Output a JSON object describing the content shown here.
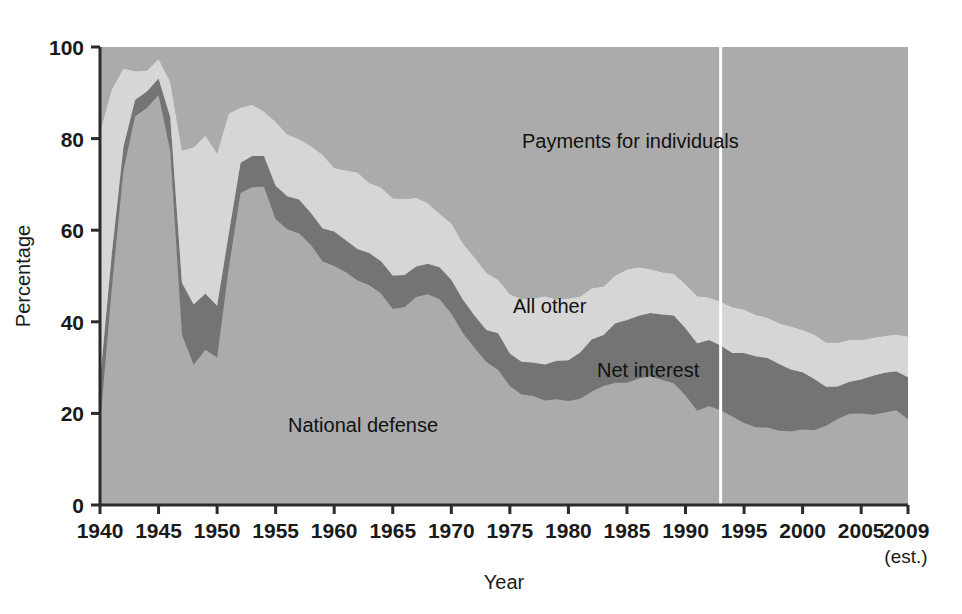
{
  "chart_data": {
    "type": "area",
    "stacked": true,
    "title": "",
    "xlabel": "Year",
    "ylabel": "Percentage",
    "xlim": [
      1940,
      2009
    ],
    "ylim": [
      0,
      100
    ],
    "grid": false,
    "legend_position": "inline-annotations",
    "x_tick_labels": [
      "1940",
      "1945",
      "1950",
      "1955",
      "1960",
      "1965",
      "1970",
      "1975",
      "1980",
      "1985",
      "1990",
      "1995",
      "2000",
      "2005",
      "2009"
    ],
    "x_tick_values": [
      1940,
      1945,
      1950,
      1955,
      1960,
      1965,
      1970,
      1975,
      1980,
      1985,
      1990,
      1995,
      2000,
      2005,
      2009
    ],
    "y_tick_labels": [
      "0",
      "20",
      "40",
      "60",
      "80",
      "100"
    ],
    "y_tick_values": [
      0,
      20,
      40,
      60,
      80,
      100
    ],
    "last_point_note": "(est.)",
    "projection_divider_year": 1993,
    "colors": {
      "national_defense": "#ababab",
      "net_interest": "#747474",
      "all_other": "#d6d6d6",
      "payments_for_individuals": "#ababab",
      "plot_background": "#ababab",
      "axis": "#2b2b2b",
      "divider": "#ffffff"
    },
    "x": [
      1940,
      1941,
      1942,
      1943,
      1944,
      1945,
      1946,
      1947,
      1948,
      1949,
      1950,
      1951,
      1952,
      1953,
      1954,
      1955,
      1956,
      1957,
      1958,
      1959,
      1960,
      1961,
      1962,
      1963,
      1964,
      1965,
      1966,
      1967,
      1968,
      1969,
      1970,
      1971,
      1972,
      1973,
      1974,
      1975,
      1976,
      1977,
      1978,
      1979,
      1980,
      1981,
      1982,
      1983,
      1984,
      1985,
      1986,
      1987,
      1988,
      1989,
      1990,
      1991,
      1992,
      1993,
      1994,
      1995,
      1996,
      1997,
      1998,
      1999,
      2000,
      2001,
      2002,
      2003,
      2004,
      2005,
      2006,
      2007,
      2008,
      2009
    ],
    "series": [
      {
        "name": "National defense",
        "color": "#ababab",
        "values": [
          17.5,
          47.1,
          73.0,
          84.9,
          86.7,
          89.5,
          77.3,
          37.1,
          30.6,
          33.9,
          32.2,
          51.8,
          68.1,
          69.4,
          69.5,
          62.4,
          60.2,
          59.3,
          56.8,
          53.2,
          52.2,
          50.8,
          49.0,
          48.0,
          46.2,
          42.8,
          43.2,
          45.4,
          46.0,
          44.9,
          41.8,
          37.5,
          34.3,
          31.2,
          29.5,
          26.0,
          24.1,
          23.8,
          22.8,
          23.1,
          22.7,
          23.2,
          24.8,
          26.0,
          26.7,
          26.7,
          27.6,
          28.1,
          27.3,
          26.6,
          23.9,
          20.6,
          21.6,
          20.7,
          19.3,
          17.9,
          17.0,
          16.9,
          16.2,
          16.1,
          16.5,
          16.4,
          17.3,
          18.8,
          19.9,
          20.0,
          19.7,
          20.2,
          20.7,
          18.7
        ]
      },
      {
        "name": "Net interest",
        "color": "#747474",
        "values": [
          9.5,
          7.6,
          5.2,
          3.6,
          3.6,
          3.6,
          7.4,
          11.4,
          13.2,
          12.3,
          11.3,
          7.5,
          6.6,
          6.8,
          6.7,
          7.3,
          7.2,
          7.4,
          7.0,
          7.2,
          7.5,
          7.0,
          6.9,
          7.0,
          7.0,
          7.3,
          7.0,
          6.7,
          6.7,
          7.0,
          7.4,
          7.3,
          7.0,
          7.0,
          8.0,
          7.1,
          7.2,
          7.3,
          7.9,
          8.4,
          8.9,
          10.1,
          11.4,
          11.1,
          13.0,
          13.7,
          13.7,
          13.8,
          14.3,
          14.8,
          14.7,
          14.7,
          14.4,
          14.1,
          13.9,
          15.3,
          15.5,
          15.2,
          14.6,
          13.5,
          12.5,
          11.1,
          8.5,
          7.1,
          7.0,
          7.4,
          8.5,
          8.7,
          8.5,
          9.2
        ]
      },
      {
        "name": "All other",
        "color": "#d6d6d6",
        "values": [
          54.5,
          36.0,
          17.1,
          6.2,
          4.5,
          4.3,
          7.7,
          28.9,
          34.3,
          34.5,
          33.3,
          26.2,
          12.1,
          11.2,
          9.7,
          14.0,
          13.5,
          13.2,
          14.6,
          16.1,
          13.9,
          15.3,
          16.7,
          15.3,
          16.1,
          16.9,
          16.6,
          15.0,
          13.2,
          11.7,
          12.3,
          12.3,
          12.7,
          12.5,
          11.7,
          12.9,
          13.7,
          14.0,
          14.9,
          13.4,
          13.5,
          12.2,
          11.1,
          10.6,
          10.4,
          11.0,
          10.6,
          9.6,
          9.2,
          9.1,
          9.6,
          10.3,
          9.3,
          9.6,
          10.0,
          9.5,
          9.0,
          8.8,
          8.9,
          9.4,
          9.2,
          9.7,
          9.7,
          9.5,
          9.1,
          8.6,
          8.3,
          8.0,
          8.0,
          8.9
        ]
      },
      {
        "name": "Payments for individuals",
        "color": "#ababab",
        "values": [
          18.5,
          9.3,
          4.7,
          5.3,
          5.2,
          2.6,
          7.6,
          22.6,
          21.9,
          19.3,
          23.2,
          14.5,
          13.2,
          12.6,
          14.1,
          16.3,
          19.1,
          20.1,
          21.6,
          23.5,
          26.4,
          26.9,
          27.4,
          29.7,
          30.7,
          33.0,
          33.2,
          32.9,
          34.1,
          36.4,
          38.5,
          42.9,
          46.0,
          49.3,
          50.8,
          54.0,
          55.0,
          54.9,
          54.4,
          55.1,
          54.9,
          54.5,
          52.7,
          52.3,
          49.9,
          48.6,
          48.1,
          48.5,
          49.2,
          49.5,
          51.8,
          54.4,
          54.7,
          55.6,
          56.8,
          57.3,
          58.5,
          59.1,
          60.3,
          61.0,
          61.8,
          62.8,
          64.5,
          64.6,
          64.0,
          64.0,
          63.5,
          63.1,
          62.8,
          63.2
        ]
      }
    ],
    "annotations": [
      {
        "text": "Payments for individuals",
        "x_px": 522,
        "y_px": 148
      },
      {
        "text": "All other",
        "x_px": 513,
        "y_px": 313
      },
      {
        "text": "Net interest",
        "x_px": 597,
        "y_px": 377
      },
      {
        "text": "National defense",
        "x_px": 288,
        "y_px": 432
      }
    ]
  },
  "axes": {
    "y_title": "Percentage",
    "x_title": "Year"
  }
}
